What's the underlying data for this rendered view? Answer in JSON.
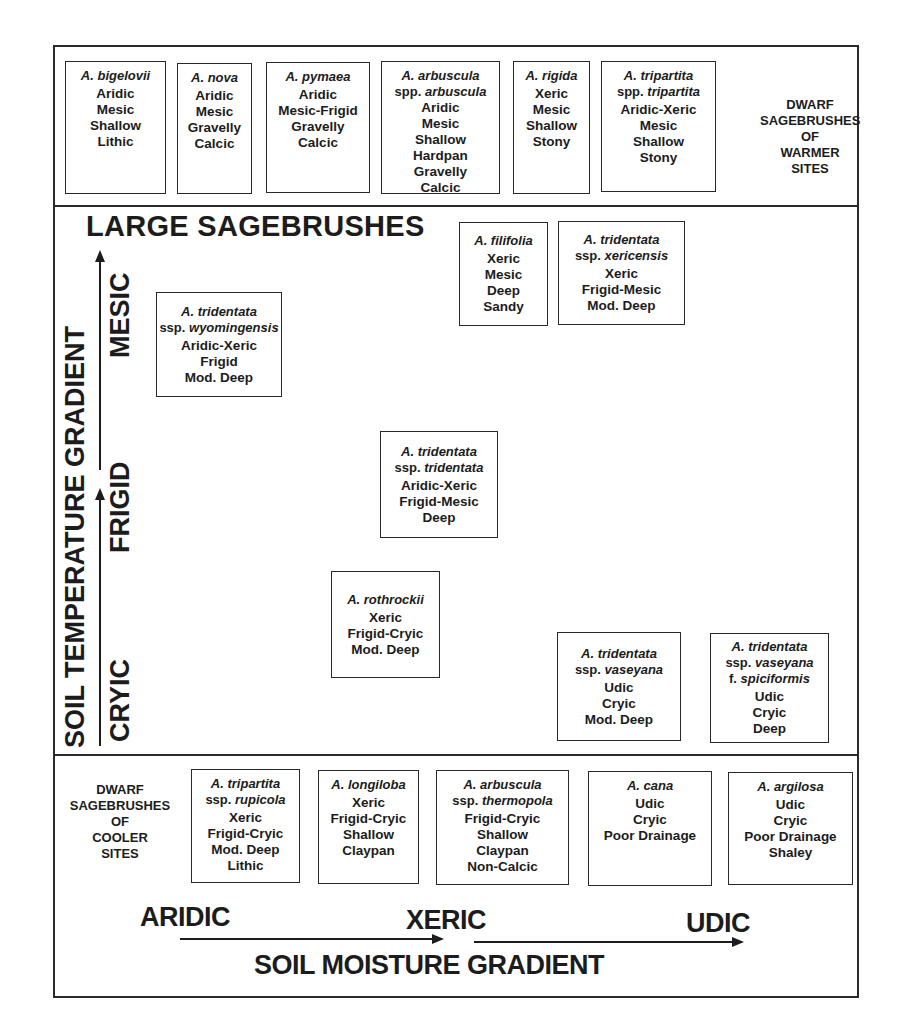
{
  "diagram": {
    "sections": {
      "warmer": {
        "label_lines": [
          "DWARF",
          "SAGEBRUSHES",
          "OF",
          "WARMER",
          "SITES"
        ],
        "boxes": [
          {
            "name": "A. bigelovii",
            "sub": null,
            "traits": [
              "Aridic",
              "Mesic",
              "Shallow",
              "Lithic"
            ]
          },
          {
            "name": "A. nova",
            "sub": null,
            "traits": [
              "Aridic",
              "Mesic",
              "Gravelly",
              "Calcic"
            ]
          },
          {
            "name": "A. pymaea",
            "sub": null,
            "traits": [
              "Aridic",
              "Mesic-Frigid",
              "Gravelly",
              "Calcic"
            ]
          },
          {
            "name": "A. arbuscula",
            "sub_prefix": "spp.",
            "sub": "arbuscula",
            "traits": [
              "Aridic",
              "Mesic",
              "Shallow",
              "Hardpan",
              "Gravelly",
              "Calcic"
            ]
          },
          {
            "name": "A. rigida",
            "sub": null,
            "traits": [
              "Xeric",
              "Mesic",
              "Shallow",
              "Stony"
            ]
          },
          {
            "name": "A. tripartita",
            "sub_prefix": "spp.",
            "sub": "tripartita",
            "traits": [
              "Aridic-Xeric",
              "Mesic",
              "Shallow",
              "Stony"
            ]
          }
        ]
      },
      "large": {
        "title": "LARGE SAGEBRUSHES",
        "boxes": [
          {
            "name": "A. filifolia",
            "sub": null,
            "traits": [
              "Xeric",
              "Mesic",
              "Deep",
              "Sandy"
            ]
          },
          {
            "name": "A. tridentata",
            "sub_prefix": "ssp.",
            "sub": "xericensis",
            "traits": [
              "Xeric",
              "Frigid-Mesic",
              "Mod. Deep"
            ]
          },
          {
            "name": "A. tridentata",
            "sub_prefix": "ssp.",
            "sub": "wyomingensis",
            "traits": [
              "Aridic-Xeric",
              "Frigid",
              "Mod. Deep"
            ]
          },
          {
            "name": "A. tridentata",
            "sub_prefix": "ssp.",
            "sub": "tridentata",
            "traits": [
              "Aridic-Xeric",
              "Frigid-Mesic",
              "Deep"
            ]
          },
          {
            "name": "A. rothrockii",
            "sub": null,
            "traits": [
              "Xeric",
              "Frigid-Cryic",
              "Mod. Deep"
            ]
          },
          {
            "name": "A. tridentata",
            "sub_prefix": "ssp.",
            "sub": "vaseyana",
            "traits": [
              "Udic",
              "Cryic",
              "Mod. Deep"
            ]
          },
          {
            "name": "A. tridentata",
            "sub_prefix": "ssp.",
            "sub": "vaseyana",
            "sub2_prefix": "f.",
            "sub2": "spiciformis",
            "traits": [
              "Udic",
              "Cryic",
              "Deep"
            ]
          }
        ]
      },
      "cooler": {
        "label_lines": [
          "DWARF",
          "SAGEBRUSHES",
          "OF",
          "COOLER",
          "SITES"
        ],
        "boxes": [
          {
            "name": "A. tripartita",
            "sub_prefix": "ssp.",
            "sub": "rupicola",
            "traits": [
              "Xeric",
              "Frigid-Cryic",
              "Mod. Deep",
              "Lithic"
            ]
          },
          {
            "name": "A. longiloba",
            "sub": null,
            "traits": [
              "Xeric",
              "Frigid-Cryic",
              "Shallow",
              "Claypan"
            ]
          },
          {
            "name": "A. arbuscula",
            "sub_prefix": "ssp.",
            "sub": "thermopola",
            "traits": [
              "Frigid-Cryic",
              "Shallow",
              "Claypan",
              "Non-Calcic"
            ]
          },
          {
            "name": "A. cana",
            "sub": null,
            "traits": [
              "Udic",
              "Cryic",
              "Poor Drainage"
            ]
          },
          {
            "name": "A. argilosa",
            "sub": null,
            "traits": [
              "Udic",
              "Cryic",
              "Poor Drainage",
              "Shaley"
            ]
          }
        ]
      }
    },
    "temperature_axis": {
      "title": "SOIL TEMPERATURE GRADIENT",
      "levels": [
        "CRYIC",
        "FRIGID",
        "MESIC"
      ]
    },
    "moisture_axis": {
      "title": "SOIL MOISTURE GRADIENT",
      "levels": [
        "ARIDIC",
        "XERIC",
        "UDIC"
      ]
    }
  }
}
